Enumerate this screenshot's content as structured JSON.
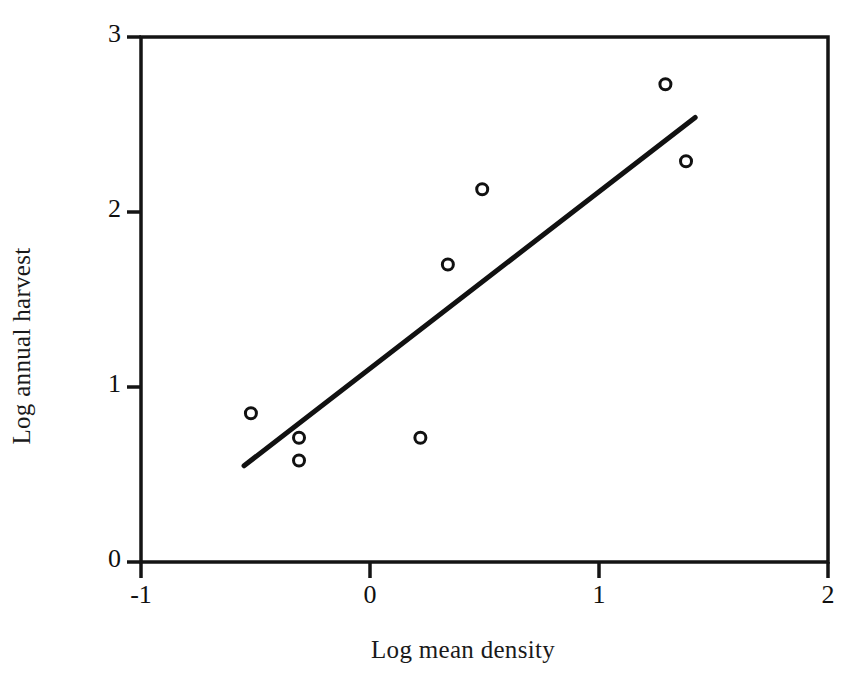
{
  "figure": {
    "background_color": "#ffffff",
    "ink_color": "#111111"
  },
  "chart_data": {
    "type": "scatter",
    "title": "",
    "subtitle": "",
    "xlabel": "Log mean density",
    "ylabel": "Log annual harvest",
    "xlim": [
      -1,
      2
    ],
    "ylim": [
      0,
      3
    ],
    "xticks": [
      -1,
      0,
      1,
      2
    ],
    "xtick_labels": [
      "-1",
      "0",
      "1",
      "2"
    ],
    "yticks": [
      0,
      1,
      2,
      3
    ],
    "ytick_labels": [
      "0",
      "1",
      "2",
      "3"
    ],
    "grid": false,
    "legend": null,
    "legend_position": "none",
    "frame": "box",
    "marker": {
      "shape": "open-circle",
      "size_px": 11,
      "edge_color": "#111111",
      "fill_color": "#ffffff",
      "edge_width_px": 3
    },
    "series": [
      {
        "name": "observations",
        "type": "scatter",
        "points": [
          {
            "x": -0.52,
            "y": 0.85
          },
          {
            "x": -0.31,
            "y": 0.71
          },
          {
            "x": -0.31,
            "y": 0.58
          },
          {
            "x": 0.22,
            "y": 0.71
          },
          {
            "x": 0.34,
            "y": 1.7
          },
          {
            "x": 0.49,
            "y": 2.13
          },
          {
            "x": 1.29,
            "y": 2.73
          },
          {
            "x": 1.38,
            "y": 2.29
          }
        ]
      },
      {
        "name": "regression-line",
        "type": "line",
        "color": "#111111",
        "width_px": 5,
        "endpoints": [
          {
            "x": -0.55,
            "y": 0.55
          },
          {
            "x": 1.42,
            "y": 2.54
          }
        ]
      }
    ],
    "annotations": []
  },
  "axes": {
    "x_title": "Log mean density",
    "y_title": "Log annual harvest",
    "x_tick_labels": [
      "-1",
      "0",
      "1",
      "2"
    ],
    "y_tick_labels": [
      "0",
      "1",
      "2",
      "3"
    ]
  }
}
